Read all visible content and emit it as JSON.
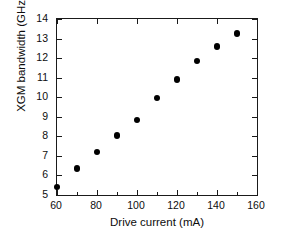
{
  "chart_data": {
    "type": "scatter",
    "title": "",
    "xlabel": "Drive current (mA)",
    "ylabel": "XGM bandwidth (GHz)",
    "xlim": [
      60,
      160
    ],
    "ylim": [
      5,
      14
    ],
    "xticks": [
      60,
      80,
      100,
      120,
      140,
      160
    ],
    "xticks_minor": [
      70,
      90,
      110,
      130,
      150
    ],
    "yticks": [
      5,
      6,
      7,
      8,
      9,
      10,
      11,
      12,
      13,
      14
    ],
    "xtick_labels": [
      "60",
      "80",
      "100",
      "120",
      "140",
      "160"
    ],
    "ytick_labels": [
      "5",
      "6",
      "7",
      "8",
      "9",
      "10",
      "11",
      "12",
      "13",
      "14"
    ],
    "grid": false,
    "legend": null,
    "marker_color": "#000000",
    "marker_shape": "circle",
    "frame_color": "#1a1a1a",
    "background": "#ffffff",
    "x": [
      60,
      70,
      80,
      90,
      100,
      110,
      120,
      130,
      140,
      150
    ],
    "values": [
      5.4,
      6.35,
      7.2,
      8.05,
      8.85,
      9.95,
      10.9,
      11.85,
      12.6,
      13.25
    ],
    "points": [
      {
        "x": 60,
        "y": 5.4
      },
      {
        "x": 70,
        "y": 6.35
      },
      {
        "x": 80,
        "y": 7.2
      },
      {
        "x": 90,
        "y": 8.05
      },
      {
        "x": 100,
        "y": 8.85
      },
      {
        "x": 110,
        "y": 9.95
      },
      {
        "x": 120,
        "y": 10.9
      },
      {
        "x": 130,
        "y": 11.85
      },
      {
        "x": 140,
        "y": 12.6
      },
      {
        "x": 150,
        "y": 13.25
      }
    ]
  }
}
